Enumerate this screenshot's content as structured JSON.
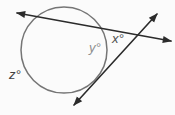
{
  "figure": {
    "background_color": "#fbfbfb",
    "line_color": "#2b2b2b",
    "circle_color": "#757575",
    "labels": {
      "z": {
        "text": "z°",
        "color": "#414141"
      },
      "y": {
        "text": "y°",
        "color": "#8e8e8e"
      },
      "x": {
        "text": "x°",
        "color": "#4f4f4f"
      }
    }
  }
}
